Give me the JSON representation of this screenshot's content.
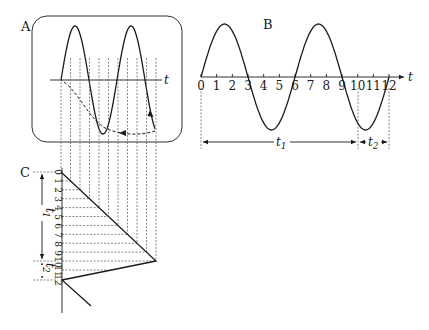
{
  "panels": {
    "A": {
      "label": "A",
      "axis_label": "t",
      "description": "Oscilloscope screen showing a sine wave trace with dashed retrace returning to start"
    },
    "B": {
      "label": "B",
      "axis_label": "t",
      "tick_labels": [
        "0",
        "1",
        "2",
        "3",
        "4",
        "5",
        "6",
        "7",
        "8",
        "9",
        "10",
        "11",
        "12"
      ],
      "dimensions": [
        {
          "label": "t",
          "subscript": "1",
          "from": "0",
          "to": "10"
        },
        {
          "label": "t",
          "subscript": "2",
          "from": "10",
          "to": "12"
        }
      ]
    },
    "C": {
      "label": "C",
      "tick_labels": [
        "0",
        "1",
        "2",
        "3",
        "4",
        "5",
        "6",
        "7",
        "8",
        "9",
        "10",
        "11",
        "12"
      ],
      "dimensions": [
        {
          "label": "t",
          "subscript": "1",
          "from": "0",
          "to": "10"
        },
        {
          "label": "t",
          "subscript": "2",
          "from": "10",
          "to": "12"
        }
      ],
      "description": "Sawtooth sweep voltage: linear ramp over t1, rapid flyback over t2"
    }
  },
  "colors": {
    "ink": "#1a1a1a",
    "dashed": "#555555",
    "background": "#ffffff"
  }
}
